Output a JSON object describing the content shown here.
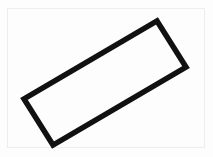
{
  "image": {
    "title": "Rotated rectangle outline line drawing",
    "width": 213,
    "height": 157,
    "background_color": "#fdfdfd",
    "caption": ""
  },
  "frame": {
    "name": "thin inset border",
    "color": "#ededed",
    "inset_left": 7,
    "inset_top": 8,
    "width": 198,
    "height": 140,
    "stroke_width": 1
  },
  "watermark": {
    "text": "",
    "color": "#f4f4f4"
  },
  "shape": {
    "name": "rectangle",
    "type": "quadrilateral-outline",
    "stroke_color": "#111111",
    "stroke_width": 5.5,
    "fill": "none",
    "linejoin": "miter",
    "rotation_degrees": -32,
    "corners": {
      "top": {
        "x": 157,
        "y": 21
      },
      "right": {
        "x": 186,
        "y": 67
      },
      "bottom": {
        "x": 53,
        "y": 145
      },
      "left": {
        "x": 24,
        "y": 99
      }
    },
    "points_attr": "157,21 186,67 53,145 24,99"
  }
}
